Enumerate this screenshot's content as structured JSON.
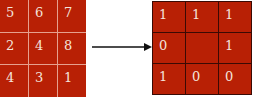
{
  "input_grid": {
    "label": "input 3x3 neighborhood",
    "rows": [
      [
        "5",
        "6",
        "7"
      ],
      [
        "2",
        "4",
        "8"
      ],
      [
        "4",
        "3",
        "1"
      ]
    ],
    "center_value": "4"
  },
  "output_grid": {
    "label": "binary pattern",
    "rows": [
      [
        "1",
        "1",
        "1"
      ],
      [
        "0",
        "",
        "1"
      ],
      [
        "1",
        "0",
        "0"
      ]
    ]
  },
  "arrow": {
    "direction": "right"
  },
  "colors": {
    "cell_fill": "#b82005",
    "left_grid_lines": "#e6a08e",
    "right_grid_lines": "#3a0a04",
    "text": "#f4e4dc"
  }
}
